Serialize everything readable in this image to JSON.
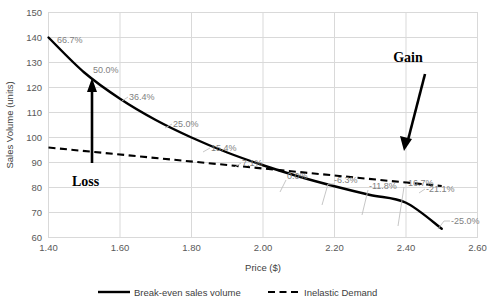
{
  "chart_data": {
    "type": "line",
    "title": "",
    "xlabel": "Price ($)",
    "ylabel": "Sales Volume (units)",
    "xlim": [
      1.4,
      2.6
    ],
    "ylim": [
      60,
      150
    ],
    "xticks": [
      "1.40",
      "1.60",
      "1.80",
      "2.00",
      "2.20",
      "2.40",
      "2.60"
    ],
    "yticks": [
      "60",
      "70",
      "80",
      "90",
      "100",
      "110",
      "120",
      "130",
      "140",
      "150"
    ],
    "grid": true,
    "legend_position": "bottom",
    "x": [
      1.4,
      1.5,
      1.6,
      1.7,
      1.8,
      1.9,
      2.0,
      2.1,
      2.2,
      2.3,
      2.4,
      2.5
    ],
    "series": [
      {
        "name": "Break-even sales volume",
        "style": "solid",
        "values": [
          140.0,
          126.0,
          115.5,
          107.0,
          100.0,
          94.0,
          88.9,
          84.4,
          80.5,
          77.0,
          73.9,
          63.5
        ]
      },
      {
        "name": "Inelastic Demand",
        "style": "dashed",
        "values": [
          96.0,
          94.6,
          93.2,
          91.8,
          90.4,
          89.0,
          87.6,
          86.2,
          84.8,
          83.4,
          82.0,
          80.6
        ]
      }
    ],
    "point_labels": [
      {
        "text": "66.7%",
        "x": 1.4,
        "value": 140.0
      },
      {
        "text": "50.0%",
        "x": 1.55,
        "value": 126.0
      },
      {
        "text": "36.4%",
        "x": 1.7,
        "value": 115.5
      },
      {
        "text": "25.0%",
        "x": 1.82,
        "value": 107.0
      },
      {
        "text": "15.4%",
        "x": 1.93,
        "value": 100.0
      },
      {
        "text": "7.1%",
        "x": 2.02,
        "value": 94.0
      },
      {
        "text": "0.0%",
        "x": 2.12,
        "value": 88.9
      },
      {
        "text": "-6.3%",
        "x": 2.22,
        "value": 84.4
      },
      {
        "text": "-11.8%",
        "x": 2.32,
        "value": 80.5
      },
      {
        "text": "-16.7%",
        "x": 2.42,
        "value": 77.0
      },
      {
        "text": "-21.1%",
        "x": 2.49,
        "value": 73.9
      },
      {
        "text": "-25.0%",
        "x": 2.56,
        "value": 63.5
      }
    ],
    "annotations": [
      {
        "label": "Gain",
        "direction": "down-left"
      },
      {
        "label": "Loss",
        "direction": "up"
      }
    ]
  },
  "legend": {
    "items": [
      {
        "label": "Break-even sales volume",
        "style": "solid"
      },
      {
        "label": "Inelastic Demand",
        "style": "dashed"
      }
    ]
  },
  "axes": {
    "y_title": "Sales Volume (units)",
    "x_title": "Price ($)"
  },
  "annotation_gain": "Gain",
  "annotation_loss": "Loss",
  "ticks": {
    "y": [
      "150",
      "140",
      "130",
      "120",
      "110",
      "100",
      "90",
      "80",
      "70",
      "60"
    ],
    "x": [
      "1.40",
      "1.60",
      "1.80",
      "2.00",
      "2.20",
      "2.40",
      "2.60"
    ]
  },
  "labels": {
    "l0": "66.7%",
    "l1": "50.0%",
    "l2": "36.4%",
    "l3": "25.0%",
    "l4": "15.4%",
    "l5": "7.1%",
    "l6": "0.0%",
    "l7": "-6.3%",
    "l8": "-11.8%",
    "l9": "-16.7%",
    "l10": "-21.1%",
    "l11": "-25.0%"
  }
}
